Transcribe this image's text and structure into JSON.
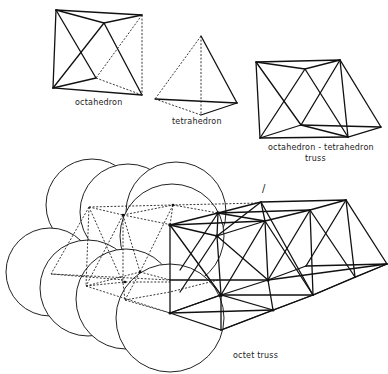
{
  "figure": {
    "labels": {
      "octahedron": "octahedron",
      "tetrahedron": "tetrahedron",
      "oct_tet_truss_line1": "octahedron - tetrahedron",
      "oct_tet_truss_line2": "truss",
      "octet_truss": "octet truss",
      "marker": "/"
    },
    "colors": {
      "ink": "#111111",
      "background": "#ffffff"
    }
  }
}
